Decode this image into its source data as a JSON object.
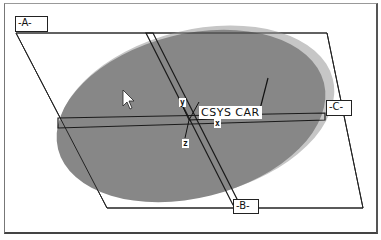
{
  "viewport": {
    "type": "cad-3d-graphics-window",
    "background": "#ffffff",
    "frame_color": "#444444"
  },
  "model": {
    "part_face_color": "#888888",
    "part_edge_highlight": "#c8c8c8",
    "shape": "elliptical-disc"
  },
  "datum_planes": [
    {
      "id": "A",
      "label": "-A-"
    },
    {
      "id": "B",
      "label": "-B-"
    },
    {
      "id": "C",
      "label": "-C-"
    }
  ],
  "coordinate_system": {
    "name": "CSYS_CAR",
    "label": "CSYS CAR",
    "axes": [
      {
        "id": "y",
        "label": "y"
      },
      {
        "id": "x",
        "label": "x"
      },
      {
        "id": "z",
        "label": "z"
      }
    ]
  },
  "cursor": {
    "icon": "arrow-pointer-icon"
  }
}
